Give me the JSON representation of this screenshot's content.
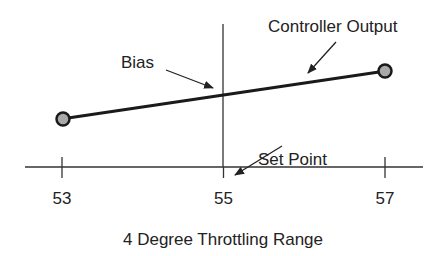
{
  "diagram": {
    "title": "4 Degree Throttling Range",
    "axis": {
      "ticks": [
        {
          "value": 53,
          "label": "53"
        },
        {
          "value": 55,
          "label": "55"
        },
        {
          "value": 57,
          "label": "57"
        }
      ]
    },
    "annotations": {
      "bias": "Bias",
      "controller_output": "Controller Output",
      "set_point": "Set Point"
    },
    "controller_output_line": {
      "start_value": 53,
      "end_value": 57,
      "endpoint_fill": "#a9a9a9"
    },
    "colors": {
      "line": "#1a1a1a",
      "axis": "#333333",
      "text": "#222222"
    }
  }
}
